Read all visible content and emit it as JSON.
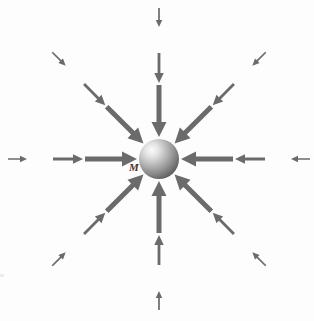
{
  "figure": {
    "type": "vector-field-diagram",
    "background_color": "#fdfdfd",
    "width": 314,
    "height": 321
  },
  "mass": {
    "label": "M",
    "center_x": 159,
    "center_y": 159,
    "radius": 20,
    "highlight_color": "#f2f2f2",
    "mid_color": "#9a9a9a",
    "edge_color": "#5e5e5e",
    "highlight_offset_x": -7,
    "highlight_offset_y": -8
  },
  "arrows": {
    "color": "#6b6b6b",
    "count_total": 24,
    "rings_per_direction": 3,
    "directions": [
      {
        "name": "from-left",
        "angle_deg": 0,
        "unicode": "→"
      },
      {
        "name": "from-upper-left",
        "angle_deg": 45,
        "unicode": "↘"
      },
      {
        "name": "from-top",
        "angle_deg": 90,
        "unicode": "↓"
      },
      {
        "name": "from-upper-right",
        "angle_deg": 135,
        "unicode": "↙"
      },
      {
        "name": "from-right",
        "angle_deg": 180,
        "unicode": "←"
      },
      {
        "name": "from-lower-right",
        "angle_deg": 225,
        "unicode": "↖"
      },
      {
        "name": "from-bottom",
        "angle_deg": 270,
        "unicode": "↑"
      },
      {
        "name": "from-lower-left",
        "angle_deg": 315,
        "unicode": "↗"
      }
    ],
    "rings": [
      {
        "ring": "inner",
        "tip_radius": 22,
        "length": 52,
        "shaft_width": 5.0,
        "head_width": 15.0,
        "head_length": 15.0
      },
      {
        "ring": "middle",
        "tip_radius": 76,
        "length": 30,
        "shaft_width": 2.8,
        "head_width": 9.5,
        "head_length": 10.0
      },
      {
        "ring": "outer",
        "tip_radius": 132,
        "length": 19,
        "shaft_width": 1.7,
        "head_width": 6.5,
        "head_length": 7.0
      }
    ]
  },
  "chart_data": {
    "type": "scatter",
    "xlabel": "",
    "ylabel": "",
    "annotations": [
      "M"
    ],
    "series": [
      {
        "name": "field-vectors",
        "description": "Inward-pointing vectors; magnitude grows as distance to the mass decreases",
        "points": [
          {
            "direction": "from-left",
            "ring": "outer",
            "distance": 132,
            "magnitude": 1
          },
          {
            "direction": "from-left",
            "ring": "middle",
            "distance": 76,
            "magnitude": 2
          },
          {
            "direction": "from-left",
            "ring": "inner",
            "distance": 22,
            "magnitude": 3
          },
          {
            "direction": "from-upper-left",
            "ring": "outer",
            "distance": 132,
            "magnitude": 1
          },
          {
            "direction": "from-upper-left",
            "ring": "middle",
            "distance": 76,
            "magnitude": 2
          },
          {
            "direction": "from-upper-left",
            "ring": "inner",
            "distance": 22,
            "magnitude": 3
          },
          {
            "direction": "from-top",
            "ring": "outer",
            "distance": 132,
            "magnitude": 1
          },
          {
            "direction": "from-top",
            "ring": "middle",
            "distance": 76,
            "magnitude": 2
          },
          {
            "direction": "from-top",
            "ring": "inner",
            "distance": 22,
            "magnitude": 3
          },
          {
            "direction": "from-upper-right",
            "ring": "outer",
            "distance": 132,
            "magnitude": 1
          },
          {
            "direction": "from-upper-right",
            "ring": "middle",
            "distance": 76,
            "magnitude": 2
          },
          {
            "direction": "from-upper-right",
            "ring": "inner",
            "distance": 22,
            "magnitude": 3
          },
          {
            "direction": "from-right",
            "ring": "outer",
            "distance": 132,
            "magnitude": 1
          },
          {
            "direction": "from-right",
            "ring": "middle",
            "distance": 76,
            "magnitude": 2
          },
          {
            "direction": "from-right",
            "ring": "inner",
            "distance": 22,
            "magnitude": 3
          },
          {
            "direction": "from-lower-right",
            "ring": "outer",
            "distance": 132,
            "magnitude": 1
          },
          {
            "direction": "from-lower-right",
            "ring": "middle",
            "distance": 76,
            "magnitude": 2
          },
          {
            "direction": "from-lower-right",
            "ring": "inner",
            "distance": 22,
            "magnitude": 3
          },
          {
            "direction": "from-bottom",
            "ring": "outer",
            "distance": 132,
            "magnitude": 1
          },
          {
            "direction": "from-bottom",
            "ring": "middle",
            "distance": 76,
            "magnitude": 2
          },
          {
            "direction": "from-bottom",
            "ring": "inner",
            "distance": 22,
            "magnitude": 3
          },
          {
            "direction": "from-lower-left",
            "ring": "outer",
            "distance": 132,
            "magnitude": 1
          },
          {
            "direction": "from-lower-left",
            "ring": "middle",
            "distance": 76,
            "magnitude": 2
          },
          {
            "direction": "from-lower-left",
            "ring": "inner",
            "distance": 22,
            "magnitude": 3
          }
        ]
      }
    ],
    "grid": false,
    "legend": "none"
  }
}
